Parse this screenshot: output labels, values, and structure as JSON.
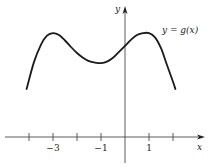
{
  "chart_data": {
    "type": "line",
    "title": "",
    "curve_label": "y = g(x)",
    "xlabel": "x",
    "ylabel": "y",
    "xlim": [
      -5.2,
      3.6
    ],
    "ylim": [
      -1.3,
      5.6
    ],
    "x_ticks": [
      -4,
      -3,
      -2,
      -1,
      0,
      1,
      2
    ],
    "x_tick_labels": [
      {
        "value": -3,
        "label": "−3"
      },
      {
        "value": -1,
        "label": "−1"
      },
      {
        "value": 1,
        "label": "1"
      }
    ],
    "grid": false,
    "series": [
      {
        "name": "g(x)",
        "x": [
          -4.1,
          -3.8,
          -3.5,
          -3.25,
          -3.0,
          -2.75,
          -2.5,
          -2.25,
          -2.0,
          -1.75,
          -1.5,
          -1.25,
          -1.0,
          -0.75,
          -0.5,
          -0.25,
          0.0,
          0.25,
          0.5,
          0.75,
          1.0,
          1.25,
          1.5,
          1.75,
          2.0,
          2.1
        ],
        "y": [
          2.0,
          3.1,
          3.85,
          4.22,
          4.33,
          4.25,
          4.02,
          3.75,
          3.5,
          3.3,
          3.16,
          3.1,
          3.08,
          3.14,
          3.3,
          3.55,
          3.8,
          4.05,
          4.25,
          4.33,
          4.33,
          4.15,
          3.7,
          3.0,
          2.3,
          2.0
        ]
      }
    ]
  }
}
